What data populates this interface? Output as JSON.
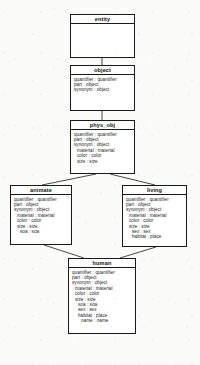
{
  "diagram": {
    "type": "uml-class-diagram",
    "line_color": "#1a1a1a",
    "box_fill": "#ffffff",
    "background": "#fbfbfa"
  },
  "classes": [
    {
      "id": "entity",
      "name": "entity",
      "attributes": []
    },
    {
      "id": "object",
      "name": "object",
      "attributes": [
        {
          "text": "quantifier : quantifier",
          "indent": 0
        },
        {
          "text": "part : object",
          "indent": 0
        },
        {
          "text": "synonym : object",
          "indent": 0
        }
      ]
    },
    {
      "id": "phys_obj",
      "name": "phys_obj",
      "attributes": [
        {
          "text": "quantifier : quantifier",
          "indent": 0
        },
        {
          "text": "part : object",
          "indent": 0
        },
        {
          "text": "synonym : object",
          "indent": 0
        },
        {
          "text": "material : material",
          "indent": 1
        },
        {
          "text": "color : color",
          "indent": 1
        },
        {
          "text": "size : size",
          "indent": 1
        }
      ]
    },
    {
      "id": "animate",
      "name": "animate",
      "attributes": [
        {
          "text": "quantifier : quantifier",
          "indent": 0
        },
        {
          "text": "part : object",
          "indent": 0
        },
        {
          "text": "synonym : object",
          "indent": 0
        },
        {
          "text": "material : material",
          "indent": 1
        },
        {
          "text": "color : color",
          "indent": 1
        },
        {
          "text": "size : size",
          "indent": 1
        },
        {
          "text": "soa : soa",
          "indent": 2
        }
      ]
    },
    {
      "id": "living",
      "name": "living",
      "attributes": [
        {
          "text": "quantifier : quantifier",
          "indent": 0
        },
        {
          "text": "part : object",
          "indent": 0
        },
        {
          "text": "synonym : object",
          "indent": 0
        },
        {
          "text": "material : material",
          "indent": 1
        },
        {
          "text": "color : color",
          "indent": 1
        },
        {
          "text": "size : size",
          "indent": 1
        },
        {
          "text": "sex : sex",
          "indent": 2
        },
        {
          "text": "habitat : place",
          "indent": 2
        }
      ]
    },
    {
      "id": "human",
      "name": "human",
      "attributes": [
        {
          "text": "quantifier : quantifier",
          "indent": 0
        },
        {
          "text": "part : object",
          "indent": 0
        },
        {
          "text": "synonym : object",
          "indent": 0
        },
        {
          "text": "material : material",
          "indent": 1
        },
        {
          "text": "color : color",
          "indent": 1
        },
        {
          "text": "size : size",
          "indent": 1
        },
        {
          "text": "soa : soa",
          "indent": 2
        },
        {
          "text": "sex : sex",
          "indent": 2
        },
        {
          "text": "habitat : place",
          "indent": 2
        },
        {
          "text": "name : name",
          "indent": 3
        }
      ]
    }
  ],
  "edges": [
    {
      "from": "entity",
      "to": "object"
    },
    {
      "from": "object",
      "to": "phys_obj"
    },
    {
      "from": "phys_obj",
      "to": "animate"
    },
    {
      "from": "phys_obj",
      "to": "living"
    },
    {
      "from": "animate",
      "to": "human"
    },
    {
      "from": "living",
      "to": "human"
    }
  ]
}
